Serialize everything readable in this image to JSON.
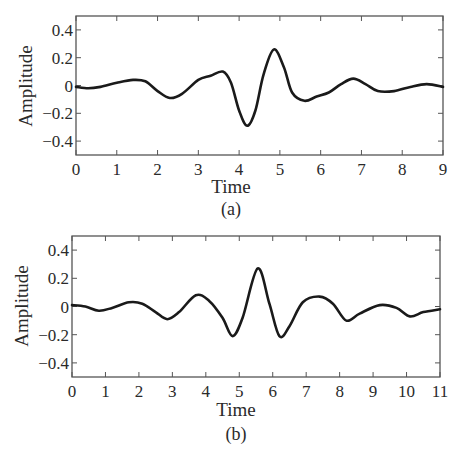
{
  "chart_data": [
    {
      "id": "a",
      "type": "line",
      "caption": "(a)",
      "title": "",
      "xlabel": "Time",
      "ylabel": "Amplitude",
      "xlim": [
        0,
        9
      ],
      "ylim": [
        -0.5,
        0.5
      ],
      "xticks": [
        0,
        1,
        2,
        3,
        4,
        5,
        6,
        7,
        8,
        9
      ],
      "xtick_labels": [
        "0",
        "1",
        "2",
        "3",
        "4",
        "5",
        "6",
        "7",
        "8",
        "9"
      ],
      "yticks": [
        0.4,
        0.2,
        0,
        -0.2,
        -0.4
      ],
      "ytick_labels": [
        "0.4",
        "0.2",
        "0",
        "−0.2",
        "−0.4"
      ],
      "grid": false,
      "legend": null,
      "line_color": "#1a1a1a",
      "series": [
        {
          "name": "signal-a",
          "x": [
            0,
            0.3,
            0.6,
            1.0,
            1.4,
            1.7,
            2.0,
            2.3,
            2.6,
            3.0,
            3.3,
            3.6,
            3.8,
            4.0,
            4.2,
            4.4,
            4.6,
            4.85,
            5.1,
            5.3,
            5.6,
            5.9,
            6.2,
            6.5,
            6.8,
            7.1,
            7.4,
            7.8,
            8.2,
            8.6,
            9.0
          ],
          "y": [
            -0.01,
            -0.02,
            -0.01,
            0.02,
            0.04,
            0.03,
            -0.04,
            -0.09,
            -0.06,
            0.04,
            0.07,
            0.1,
            0.02,
            -0.18,
            -0.29,
            -0.18,
            0.08,
            0.26,
            0.13,
            -0.05,
            -0.11,
            -0.08,
            -0.05,
            0.01,
            0.05,
            0.01,
            -0.04,
            -0.04,
            -0.01,
            0.01,
            -0.01
          ]
        }
      ]
    },
    {
      "id": "b",
      "type": "line",
      "caption": "(b)",
      "title": "",
      "xlabel": "Time",
      "ylabel": "Amplitude",
      "xlim": [
        0,
        11
      ],
      "ylim": [
        -0.5,
        0.5
      ],
      "xticks": [
        0,
        1,
        2,
        3,
        4,
        5,
        6,
        7,
        8,
        9,
        10,
        11
      ],
      "xtick_labels": [
        "0",
        "1",
        "2",
        "3",
        "4",
        "5",
        "6",
        "7",
        "8",
        "9",
        "10",
        "11"
      ],
      "yticks": [
        0.4,
        0.2,
        0,
        -0.2,
        -0.4
      ],
      "ytick_labels": [
        "0.4",
        "0.2",
        "0",
        "−0.2",
        "−0.4"
      ],
      "grid": false,
      "legend": null,
      "line_color": "#1a1a1a",
      "series": [
        {
          "name": "signal-b",
          "x": [
            0,
            0.4,
            0.8,
            1.2,
            1.7,
            2.1,
            2.5,
            2.85,
            3.2,
            3.7,
            4.1,
            4.5,
            4.8,
            5.1,
            5.55,
            5.9,
            6.2,
            6.5,
            6.9,
            7.4,
            7.8,
            8.2,
            8.6,
            9.2,
            9.7,
            10.1,
            10.5,
            11.0
          ],
          "y": [
            0.01,
            0.0,
            -0.03,
            -0.01,
            0.03,
            0.02,
            -0.04,
            -0.09,
            -0.04,
            0.08,
            0.04,
            -0.08,
            -0.21,
            -0.08,
            0.27,
            0.02,
            -0.21,
            -0.14,
            0.03,
            0.07,
            0.02,
            -0.1,
            -0.05,
            0.01,
            -0.01,
            -0.07,
            -0.04,
            -0.02
          ]
        }
      ]
    }
  ]
}
